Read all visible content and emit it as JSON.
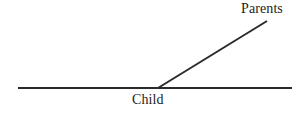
{
  "diagram": {
    "background_color": "#ffffff",
    "line_color": "#2b2b2b",
    "text_color": "#1d1d1d",
    "labels": {
      "parents": "Parents",
      "child": "Child"
    },
    "geometry": {
      "baseline": {
        "x1": 18,
        "y1": 88,
        "x2": 292,
        "y2": 88
      },
      "ray": {
        "x1": 158,
        "y1": 88,
        "x2": 267,
        "y2": 21
      },
      "vertex": {
        "x": 158,
        "y": 88
      },
      "stroke_width": 2
    }
  }
}
